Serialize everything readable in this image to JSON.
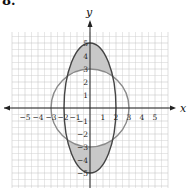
{
  "problem_number": "8.",
  "chart_data": {
    "type": "line",
    "title": "",
    "xlabel": "x",
    "ylabel": "y",
    "xlim": [
      -6,
      6
    ],
    "ylim": [
      -6,
      6
    ],
    "grid": true,
    "grid_minor_step": 0.5,
    "x_ticks": [
      -5,
      -4,
      -3,
      -2,
      -1,
      1,
      2,
      3,
      4,
      5
    ],
    "y_ticks": [
      -5,
      -4,
      -3,
      -2,
      -1,
      1,
      2,
      3,
      4,
      5
    ],
    "x_tick_labels": [
      "−5",
      "−4",
      "−3",
      "−2",
      "−1",
      "1",
      "2",
      "3",
      "4",
      "5"
    ],
    "y_tick_labels": [
      "−5",
      "−4",
      "−3",
      "−2",
      "−1",
      "1",
      "2",
      "3",
      "4",
      "5"
    ],
    "series": [
      {
        "name": "circle",
        "shape": "circle",
        "center": [
          0,
          0
        ],
        "radius": 3,
        "color": "#888888"
      },
      {
        "name": "ellipse",
        "shape": "ellipse",
        "center": [
          0,
          0
        ],
        "semi_axis_x": 2,
        "semi_axis_y": 5,
        "color": "#555555"
      }
    ],
    "shaded_regions": [
      {
        "description": "inside ellipse, outside circle, upper",
        "fill": "#c8c8c8"
      },
      {
        "description": "inside ellipse, outside circle, lower",
        "fill": "#c8c8c8"
      }
    ],
    "legend": null
  },
  "labels": {
    "x_axis": "x",
    "y_axis": "y",
    "ticks_x": {
      "n5": "−5",
      "n4": "−4",
      "n3": "−3",
      "n2": "−2",
      "n1": "−1",
      "p1": "1",
      "p2": "2",
      "p3": "3",
      "p4": "4",
      "p5": "5"
    },
    "ticks_y": {
      "n5": "−5",
      "n4": "−4",
      "n3": "−3",
      "n2": "−2",
      "n1": "−1",
      "p1": "1",
      "p2": "2",
      "p3": "3",
      "p4": "4",
      "p5": "5"
    }
  }
}
